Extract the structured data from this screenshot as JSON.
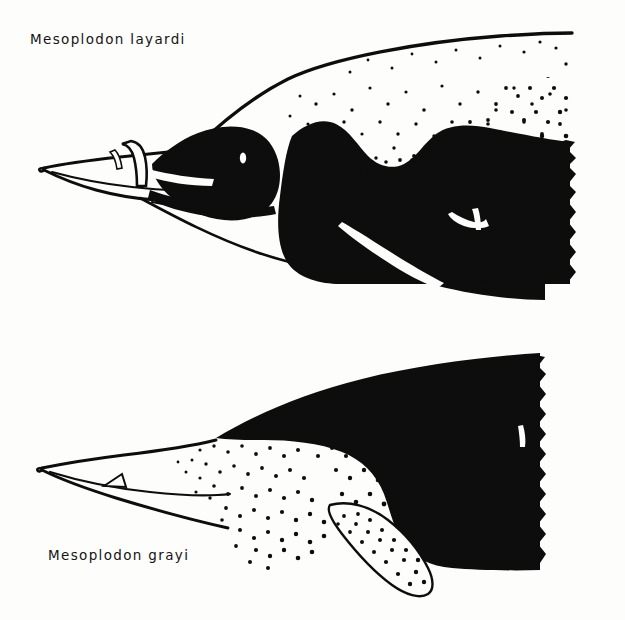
{
  "plate": {
    "background_color": "#fdfdfc",
    "ink_color": "#0d0d0d",
    "width": 625,
    "height": 620,
    "medium": "line-and-stipple ink illustration"
  },
  "figures": [
    {
      "id": "upper",
      "label": "Mesoplodon layardi",
      "common_name": "strap-toothed whale",
      "label_position": {
        "x": 30,
        "y": 44
      },
      "view": "lateral, anterior portion, body cropped at right edge",
      "features": [
        "long white beak outlined in ink",
        "arched strap tooth crossing over the upper jaw",
        "black melon and face cap",
        "white eye spot within black cap",
        "white dorsal cape with graded stipple",
        "black flank patch with white-outlined flipper",
        "throat groove line"
      ]
    },
    {
      "id": "lower",
      "label": "Mesoplodon grayi",
      "common_name": "Gray's beaked whale",
      "label_position": {
        "x": 48,
        "y": 560
      },
      "view": "lateral, anterior portion, body cropped at right edge",
      "features": [
        "long slender white beak outlined in ink",
        "small triangular tooth on lower jaw",
        "white eye spot",
        "solid black dorsal body",
        "stippled gradient along the flank",
        "pale stippled flipper outlined in ink"
      ]
    }
  ],
  "stipple": {
    "upper_cape_dot_count": 430,
    "upper_transition_dot_count": 520,
    "lower_flank_dot_count": 560,
    "lower_flipper_dot_count": 120,
    "dot_color": "#0d0d0d"
  }
}
